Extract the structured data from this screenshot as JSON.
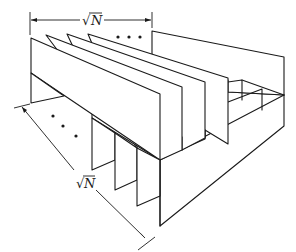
{
  "figure": {
    "top_dimension": {
      "radical": "√",
      "variable": "N",
      "label": "√N"
    },
    "side_dimension": {
      "radical": "√",
      "variable": "N",
      "label": "√N"
    },
    "top_ellipsis": "• • •",
    "side_ellipsis": "• • •",
    "colors": {
      "line": "#1a1a1a",
      "background": "#ffffff"
    }
  }
}
